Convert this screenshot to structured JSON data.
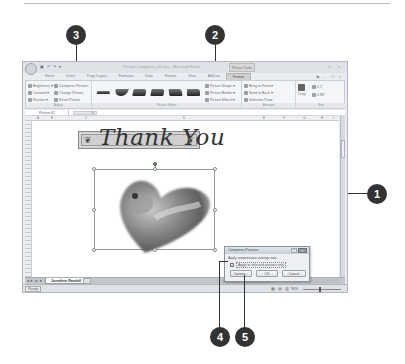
{
  "window": {
    "title": "Picture Compress_02.xlsx - Microsoft Excel",
    "context_tab_group": "Picture Tools",
    "quick_access": "▣ ↶ ↷ ▾",
    "controls": "– □ ×"
  },
  "ribbon": {
    "tabs": [
      "Home",
      "Insert",
      "Page Layout",
      "Formulas",
      "Data",
      "Review",
      "View",
      "Add-Ins",
      "Format"
    ],
    "active_tab": "Format",
    "right_controls": "◉ – □ ×",
    "adjust": {
      "label": "Adjust",
      "brightness": "Brightness ▾",
      "contrast": "Contrast ▾",
      "recolor": "Recolor ▾",
      "compress_pictures": "Compress Pictures",
      "change_picture": "Change Picture",
      "reset_picture": "Reset Picture"
    },
    "picture_styles": {
      "label": "Picture Styles",
      "shape": "Picture Shape ▾",
      "border": "Picture Border ▾",
      "effects": "Picture Effects ▾"
    },
    "arrange": {
      "label": "Arrange",
      "bring_to_front": "Bring to Front ▾",
      "send_to_back": "Send to Back ▾",
      "selection_pane": "Selection Pane"
    },
    "size": {
      "label": "Size",
      "crop": "Crop",
      "height": "2.1\"",
      "width": "2.88\""
    }
  },
  "formula_bar": {
    "name_box": "Picture 62",
    "fx": "fx"
  },
  "columns": [
    "A",
    "B",
    "C",
    "D",
    "E",
    "F",
    "G",
    "H",
    "I"
  ],
  "sheet": {
    "banner_text": "Thank You",
    "banner_ornament": "❦"
  },
  "dialog": {
    "title": "Compress Pictures",
    "help": "?",
    "close": "✕",
    "label": "Apply compression settings now",
    "checkbox_label": "Apply to selected pictures only",
    "checkbox_checked": "✓",
    "options_button": "Options...",
    "ok_button": "OK",
    "cancel_button": "Cancel"
  },
  "sheet_tabs": {
    "nav": "◂◂ ◂ ▸ ▸▸",
    "active": "Jonathon Randall"
  },
  "status": {
    "ready": "Ready",
    "views": "▦ ▤ ▥",
    "zoom": "90%"
  },
  "callouts": [
    "1",
    "2",
    "3",
    "4",
    "5"
  ]
}
